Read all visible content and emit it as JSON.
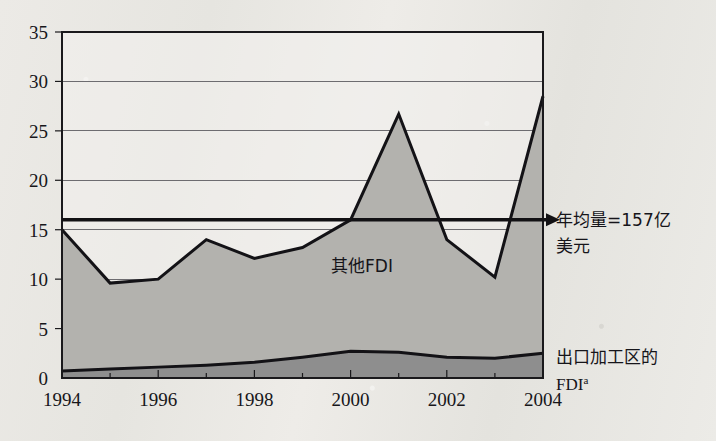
{
  "chart_data": {
    "type": "area",
    "title": "",
    "subtitle": "",
    "xlabel": "",
    "ylabel": "",
    "stacked": true,
    "grid": true,
    "legend_position": "inline-annotations",
    "x": [
      1994,
      1995,
      1996,
      1997,
      1998,
      1999,
      2000,
      2001,
      2002,
      2003,
      2004
    ],
    "xlim": [
      1994,
      2004
    ],
    "ylim": [
      0,
      35
    ],
    "yticks": [
      0,
      5,
      10,
      15,
      20,
      25,
      30,
      35
    ],
    "xticks": [
      1994,
      1996,
      1998,
      2000,
      2002,
      2004
    ],
    "xtick_labels": [
      "1994",
      "1996",
      "1998",
      "2000",
      "2002",
      "2004"
    ],
    "ytick_labels": [
      "0",
      "5",
      "10",
      "15",
      "20",
      "25",
      "30",
      "35"
    ],
    "minor_xticks": [
      1995,
      1997,
      1999,
      2001,
      2003
    ],
    "series": [
      {
        "name": "出口加工区的FDI",
        "name_suffix": "a",
        "key": "epz",
        "color": "#8e8e8e",
        "values": [
          0.7,
          0.9,
          1.1,
          1.3,
          1.6,
          2.1,
          2.7,
          2.6,
          2.1,
          2.0,
          2.5
        ]
      },
      {
        "name": "其他FDI",
        "key": "other",
        "color": "#b3b2ae",
        "values": [
          14.3,
          8.7,
          8.9,
          12.7,
          10.5,
          11.1,
          13.3,
          24.1,
          11.9,
          8.2,
          26.0
        ]
      }
    ],
    "totals": [
      15.0,
      9.6,
      10.0,
      14.0,
      12.1,
      13.2,
      16.0,
      26.7,
      14.0,
      10.2,
      28.5
    ],
    "reference_line": {
      "label_line1": "年均量=157亿",
      "label_line2": "美元",
      "value": 15.7,
      "marker": "left-arrow",
      "color": "#121114"
    },
    "inline_labels": {
      "other_fdi": "其他FDI",
      "epz_fdi_line1": "出口加工区的",
      "epz_fdi_line2": "FDI",
      "epz_fdi_superscript": "a"
    }
  },
  "style": {
    "background": "#e9e8e4",
    "axis_color": "#1a191c",
    "grid_color": "#6d6c70",
    "line_color": "#131216"
  }
}
